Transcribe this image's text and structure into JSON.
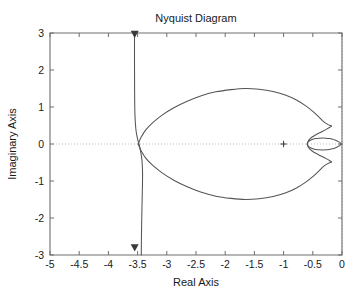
{
  "chart_data": {
    "type": "line",
    "title": "Nyquist Diagram",
    "xlabel": "Real Axis",
    "ylabel": "Imaginary Axis",
    "xlim": [
      -5,
      0
    ],
    "ylim": [
      -3,
      3
    ],
    "xticks": [
      -5,
      -4.5,
      -4,
      -3.5,
      -3,
      -2.5,
      -2,
      -1.5,
      -1,
      -0.5,
      0
    ],
    "xticklabels": [
      "-5",
      "-4.5",
      "-4",
      "-3.5",
      "-3",
      "-2.5",
      "-2",
      "-1.5",
      "-1",
      "-0.5",
      "0"
    ],
    "yticks": [
      -3,
      -2,
      -1,
      0,
      1,
      2,
      3
    ],
    "yticklabels": [
      "-3",
      "-2",
      "-1",
      "0",
      "1",
      "2",
      "3"
    ],
    "grid": false,
    "gridlines": [
      {
        "name": "zero-imaginary-gridline",
        "orientation": "horizontal",
        "value": 0,
        "style": "dotted"
      },
      {
        "name": "zero-real-gridline",
        "orientation": "vertical",
        "value": 0,
        "style": "dotted"
      }
    ],
    "legend": null,
    "annotations": [
      {
        "name": "critical-point-marker",
        "symbol": "+",
        "x": -1,
        "y": 0,
        "label": "-1 critical point"
      },
      {
        "name": "direction-arrow-top",
        "symbol": "triangle-down",
        "x": -3.55,
        "y": 2.95
      },
      {
        "name": "direction-arrow-bottom",
        "symbol": "triangle-down",
        "x": -3.55,
        "y": -2.82
      }
    ],
    "series": [
      {
        "name": "asymptote-branch",
        "comment": "near-vertical branch at Re = -3.55 running from +3 down to -3",
        "points": [
          [
            -3.553,
            3.0
          ],
          [
            -3.553,
            2.6
          ],
          [
            -3.553,
            2.2
          ],
          [
            -3.552,
            1.8
          ],
          [
            -3.551,
            1.4
          ],
          [
            -3.549,
            1.05
          ],
          [
            -3.545,
            0.78
          ],
          [
            -3.538,
            0.56
          ],
          [
            -3.528,
            0.38
          ],
          [
            -3.514,
            0.24
          ],
          [
            -3.498,
            0.12
          ],
          [
            -3.483,
            0.03
          ],
          [
            -3.476,
            0.0
          ],
          [
            -3.47,
            -0.04
          ],
          [
            -3.455,
            -0.15
          ],
          [
            -3.437,
            -0.3
          ],
          [
            -3.425,
            -0.45
          ],
          [
            -3.418,
            -0.62
          ],
          [
            -3.415,
            -0.82
          ],
          [
            -3.416,
            -1.05
          ],
          [
            -3.42,
            -1.35
          ],
          [
            -3.425,
            -1.7
          ],
          [
            -3.43,
            -2.1
          ],
          [
            -3.434,
            -2.5
          ],
          [
            -3.437,
            -3.0
          ]
        ]
      },
      {
        "name": "main-lobe-upper",
        "comment": "large upper lobe from asymptote crossing out to right, peak imag 1.5",
        "points": [
          [
            -3.49,
            0.0
          ],
          [
            -3.44,
            0.18
          ],
          [
            -3.36,
            0.38
          ],
          [
            -3.24,
            0.58
          ],
          [
            -3.08,
            0.78
          ],
          [
            -2.88,
            0.98
          ],
          [
            -2.66,
            1.15
          ],
          [
            -2.42,
            1.3
          ],
          [
            -2.16,
            1.41
          ],
          [
            -1.9,
            1.47
          ],
          [
            -1.66,
            1.5
          ],
          [
            -1.42,
            1.48
          ],
          [
            -1.18,
            1.42
          ],
          [
            -0.96,
            1.32
          ],
          [
            -0.78,
            1.19
          ],
          [
            -0.62,
            1.03
          ],
          [
            -0.49,
            0.87
          ],
          [
            -0.39,
            0.72
          ],
          [
            -0.31,
            0.6
          ],
          [
            -0.245,
            0.53
          ],
          [
            -0.2,
            0.5
          ],
          [
            -0.18,
            0.485
          ]
        ]
      },
      {
        "name": "main-lobe-lower",
        "comment": "large lower lobe, mirror of upper",
        "points": [
          [
            -3.49,
            0.0
          ],
          [
            -3.44,
            -0.18
          ],
          [
            -3.36,
            -0.38
          ],
          [
            -3.24,
            -0.58
          ],
          [
            -3.08,
            -0.78
          ],
          [
            -2.88,
            -0.98
          ],
          [
            -2.66,
            -1.15
          ],
          [
            -2.42,
            -1.3
          ],
          [
            -2.16,
            -1.41
          ],
          [
            -1.9,
            -1.47
          ],
          [
            -1.66,
            -1.5
          ],
          [
            -1.42,
            -1.48
          ],
          [
            -1.18,
            -1.42
          ],
          [
            -0.96,
            -1.32
          ],
          [
            -0.78,
            -1.19
          ],
          [
            -0.62,
            -1.03
          ],
          [
            -0.49,
            -0.87
          ],
          [
            -0.39,
            -0.72
          ],
          [
            -0.31,
            -0.6
          ],
          [
            -0.245,
            -0.53
          ],
          [
            -0.2,
            -0.5
          ],
          [
            -0.18,
            -0.485
          ]
        ]
      },
      {
        "name": "pinch-upper",
        "comment": "upper curve folds back left from the lobe tip toward the inner cusp at real axis",
        "points": [
          [
            -0.18,
            0.485
          ],
          [
            -0.215,
            0.445
          ],
          [
            -0.27,
            0.395
          ],
          [
            -0.33,
            0.345
          ],
          [
            -0.395,
            0.295
          ],
          [
            -0.455,
            0.245
          ],
          [
            -0.505,
            0.195
          ],
          [
            -0.545,
            0.145
          ],
          [
            -0.57,
            0.098
          ],
          [
            -0.585,
            0.055
          ],
          [
            -0.592,
            0.022
          ],
          [
            -0.594,
            0.0
          ]
        ]
      },
      {
        "name": "pinch-lower",
        "comment": "lower mirror of the fold-back",
        "points": [
          [
            -0.18,
            -0.485
          ],
          [
            -0.215,
            -0.445
          ],
          [
            -0.27,
            -0.395
          ],
          [
            -0.33,
            -0.345
          ],
          [
            -0.395,
            -0.295
          ],
          [
            -0.455,
            -0.245
          ],
          [
            -0.505,
            -0.195
          ],
          [
            -0.545,
            -0.145
          ],
          [
            -0.57,
            -0.098
          ],
          [
            -0.585,
            -0.055
          ],
          [
            -0.592,
            -0.022
          ],
          [
            -0.594,
            0.0
          ]
        ]
      },
      {
        "name": "inner-loop-upper",
        "comment": "small elliptical loop near the origin, upper half",
        "points": [
          [
            -0.594,
            0.0
          ],
          [
            -0.588,
            0.035
          ],
          [
            -0.57,
            0.07
          ],
          [
            -0.54,
            0.1
          ],
          [
            -0.498,
            0.126
          ],
          [
            -0.448,
            0.146
          ],
          [
            -0.392,
            0.158
          ],
          [
            -0.332,
            0.162
          ],
          [
            -0.272,
            0.158
          ],
          [
            -0.214,
            0.147
          ],
          [
            -0.162,
            0.13
          ],
          [
            -0.118,
            0.108
          ],
          [
            -0.082,
            0.083
          ],
          [
            -0.054,
            0.057
          ],
          [
            -0.032,
            0.032
          ],
          [
            -0.016,
            0.012
          ],
          [
            -0.008,
            0.0
          ]
        ]
      },
      {
        "name": "inner-loop-lower",
        "comment": "small elliptical loop near the origin, lower half",
        "points": [
          [
            -0.594,
            0.0
          ],
          [
            -0.588,
            -0.035
          ],
          [
            -0.57,
            -0.07
          ],
          [
            -0.54,
            -0.1
          ],
          [
            -0.498,
            -0.126
          ],
          [
            -0.448,
            -0.146
          ],
          [
            -0.392,
            -0.158
          ],
          [
            -0.332,
            -0.162
          ],
          [
            -0.272,
            -0.158
          ],
          [
            -0.214,
            -0.147
          ],
          [
            -0.162,
            -0.13
          ],
          [
            -0.118,
            -0.108
          ],
          [
            -0.082,
            -0.083
          ],
          [
            -0.054,
            -0.057
          ],
          [
            -0.032,
            -0.032
          ],
          [
            -0.016,
            -0.012
          ],
          [
            -0.008,
            0.0
          ]
        ]
      }
    ]
  },
  "colors": {
    "curve": "#555555",
    "axis": "#6e6e6e",
    "grid": "#bdbdbd",
    "text": "#1a1a1a",
    "background": "#ffffff"
  }
}
